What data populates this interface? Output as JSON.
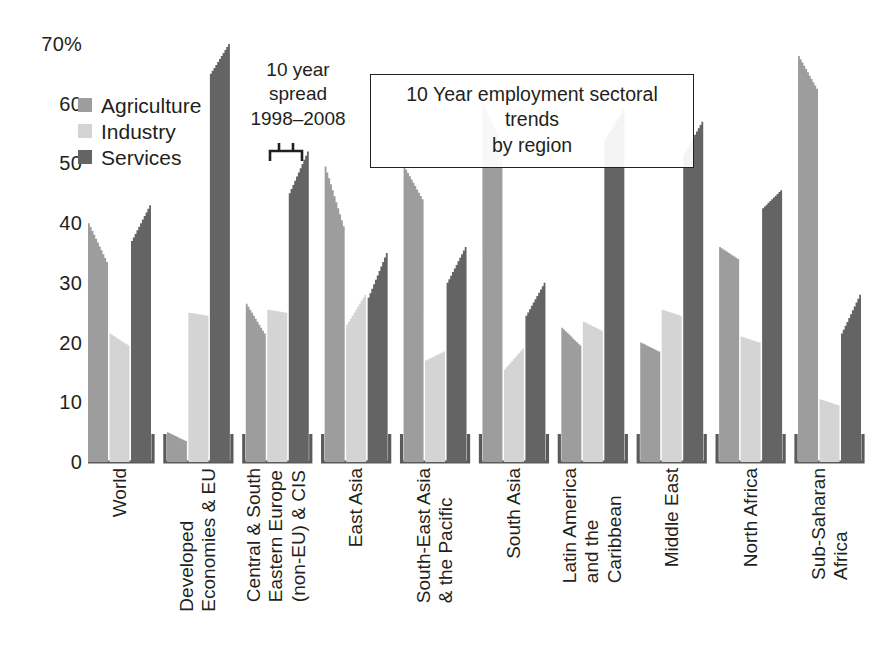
{
  "chart_data": {
    "type": "bar",
    "title": "10 Year employment sectoral trends by region",
    "xlabel": "",
    "ylabel": "",
    "ylim": [
      0,
      70
    ],
    "yticks": [
      0,
      10,
      20,
      30,
      40,
      50,
      60,
      70
    ],
    "ytick_labels": [
      "0",
      "10",
      "20",
      "30",
      "40",
      "50",
      "60",
      "70%"
    ],
    "grid": false,
    "legend_position": "top-left",
    "annotation": {
      "text": "10 year spread 1998–2008",
      "lines": [
        "10 year",
        "spread",
        "1998–2008"
      ],
      "points_to": "Central & South Eastern Europe (non-EU) & CIS / Services"
    },
    "note": "Each bar is a stepped silhouette showing the 10-year trend from 1998 (start) to 2008 (end); the bar height spans that range.",
    "categories": [
      "World",
      "Developed Economies & EU",
      "Central & South Eastern Europe (non-EU) & CIS",
      "East Asia",
      "South-East Asia & the Pacific",
      "South Asia",
      "Latin America and the Caribbean",
      "Middle East",
      "North Africa",
      "Sub-Saharan Africa"
    ],
    "series": [
      {
        "name": "Agriculture",
        "color": "#9d9d9d",
        "start_values": [
          40.0,
          5.0,
          26.5,
          49.5,
          49.5,
          60.0,
          22.5,
          20.0,
          36.0,
          68.0
        ],
        "end_values": [
          33.5,
          3.5,
          21.5,
          39.5,
          44.0,
          53.5,
          19.5,
          18.5,
          34.0,
          62.5
        ]
      },
      {
        "name": "Industry",
        "color": "#d4d4d4",
        "start_values": [
          21.5,
          25.0,
          25.5,
          23.0,
          17.0,
          15.5,
          23.5,
          25.5,
          21.0,
          10.5
        ],
        "end_values": [
          19.5,
          24.5,
          25.0,
          28.0,
          18.5,
          19.0,
          22.0,
          24.5,
          20.0,
          9.5
        ]
      },
      {
        "name": "Services",
        "color": "#646464",
        "start_values": [
          37.0,
          65.0,
          45.0,
          27.5,
          30.0,
          24.5,
          54.0,
          51.5,
          42.5,
          21.5
        ],
        "end_values": [
          43.0,
          70.0,
          52.0,
          35.0,
          36.0,
          30.0,
          59.0,
          57.0,
          45.5,
          28.0
        ]
      }
    ]
  },
  "legend": {
    "items": [
      {
        "label": "Agriculture",
        "color": "#9d9d9d"
      },
      {
        "label": "Industry",
        "color": "#d4d4d4"
      },
      {
        "label": "Services",
        "color": "#646464"
      }
    ]
  },
  "annotation": {
    "line1": "10 year",
    "line2": "spread",
    "line3": "1998–2008"
  },
  "title": {
    "line1": "10 Year employment sectoral trends",
    "line2": "by region"
  },
  "x_axis": {
    "labels": [
      {
        "lines": [
          "World"
        ]
      },
      {
        "lines": [
          "Developed",
          "Economies & EU"
        ]
      },
      {
        "lines": [
          "Central & South",
          "Eastern Europe",
          "(non-EU) & CIS"
        ]
      },
      {
        "lines": [
          "East Asia"
        ]
      },
      {
        "lines": [
          "South-East Asia",
          "& the Pacific"
        ]
      },
      {
        "lines": [
          "South Asia"
        ]
      },
      {
        "lines": [
          "Latin America",
          "and the",
          "Caribbean"
        ]
      },
      {
        "lines": [
          "Middle East"
        ]
      },
      {
        "lines": [
          "North Africa"
        ]
      },
      {
        "lines": [
          "Sub-Saharan",
          "Africa"
        ]
      }
    ]
  },
  "y_axis": {
    "ticks": [
      {
        "label": "70%",
        "value": 70
      },
      {
        "label": "60",
        "value": 60
      },
      {
        "label": "50",
        "value": 50
      },
      {
        "label": "40",
        "value": 40
      },
      {
        "label": "30",
        "value": 30
      },
      {
        "label": "20",
        "value": 20
      },
      {
        "label": "10",
        "value": 10
      },
      {
        "label": "0",
        "value": 0
      }
    ]
  },
  "colors": {
    "agriculture": "#9d9d9d",
    "industry": "#d4d4d4",
    "services": "#646464",
    "axis": "#5a5a5a",
    "text": "#231f20",
    "background": "#ffffff"
  }
}
